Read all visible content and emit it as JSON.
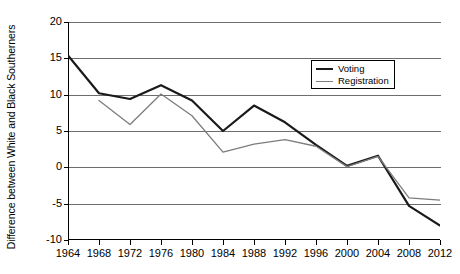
{
  "chart_data": {
    "type": "line",
    "title": "",
    "xlabel": "",
    "ylabel": "Difference between White and Black Southerners",
    "x": [
      1964,
      1968,
      1972,
      1976,
      1980,
      1984,
      1988,
      1992,
      1996,
      2000,
      2004,
      2008,
      2012
    ],
    "xlim": [
      1964,
      2012
    ],
    "ylim": [
      -10,
      20
    ],
    "ytick_labels": [
      "20",
      "15",
      "10",
      "5",
      "0",
      "-5",
      "-10"
    ],
    "ytick_values": [
      20,
      15,
      10,
      5,
      0,
      -5,
      -10
    ],
    "xtick_labels": [
      "1964",
      "1968",
      "1972",
      "1976",
      "1980",
      "1984",
      "1988",
      "1992",
      "1996",
      "2000",
      "2004",
      "2008",
      "2012"
    ],
    "grid": true,
    "legend_position": "upper right",
    "series": [
      {
        "name": "Voting",
        "color": "#1a1a1a",
        "values": [
          15.4,
          10.2,
          9.4,
          11.3,
          9.2,
          5.0,
          8.5,
          6.2,
          3.1,
          0.2,
          1.6,
          -5.3,
          -8.0
        ]
      },
      {
        "name": "Registration",
        "color": "#7d7d7d",
        "values": [
          null,
          9.2,
          5.9,
          10.1,
          7.1,
          2.1,
          3.2,
          3.8,
          2.9,
          0.1,
          1.5,
          -4.2,
          -4.5
        ]
      }
    ]
  },
  "legend": {
    "entries": [
      {
        "label": "Voting"
      },
      {
        "label": "Registration"
      }
    ]
  },
  "axes": {
    "y_title": "Difference between White and Black Southerners"
  }
}
